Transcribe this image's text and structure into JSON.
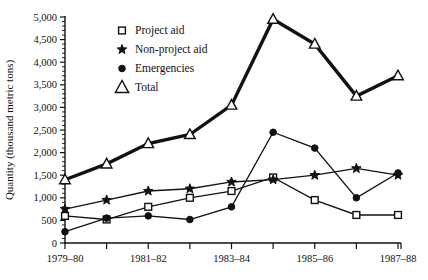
{
  "chart_data": {
    "type": "line",
    "title": "",
    "xlabel": "",
    "ylabel": "Quantity (thousand metric tons)",
    "ylim": [
      0,
      5000
    ],
    "ytick_interval": 500,
    "yminor_interval": 100,
    "grid": false,
    "legend_position": "upper-center-left",
    "categories": [
      "1979-80",
      "1980-81",
      "1981-82",
      "1982-83",
      "1983-84",
      "1984-85",
      "1985-86",
      "1986-87",
      "1987-88"
    ],
    "xtick_labels": [
      "1979–80",
      "",
      "1981–82",
      "",
      "1983–84",
      "",
      "1985–86",
      "",
      "1987–88"
    ],
    "ytick_labels": [
      "0",
      "500",
      "1,000",
      "1,500",
      "2,000",
      "2,500",
      "3,000",
      "3,500",
      "4,000",
      "4,500",
      "5,000"
    ],
    "ytick_values": [
      0,
      500,
      1000,
      1500,
      2000,
      2500,
      3000,
      3500,
      4000,
      4500,
      5000
    ],
    "series": [
      {
        "name": "Project aid",
        "marker": "square",
        "values": [
          600,
          520,
          800,
          1000,
          1150,
          1450,
          950,
          620,
          620
        ]
      },
      {
        "name": "Non-project aid",
        "marker": "star",
        "values": [
          750,
          950,
          1150,
          1200,
          1350,
          1400,
          1500,
          1650,
          1500
        ]
      },
      {
        "name": "Emergencies",
        "marker": "circle",
        "values": [
          250,
          550,
          600,
          520,
          800,
          2450,
          2100,
          1000,
          1550
        ]
      },
      {
        "name": "Total",
        "marker": "triangle",
        "values": [
          1400,
          1750,
          2200,
          2400,
          3050,
          4950,
          4400,
          3250,
          3700
        ]
      }
    ]
  },
  "legend": {
    "items": [
      {
        "label": "Project aid",
        "marker": "square"
      },
      {
        "label": "Non-project aid",
        "marker": "star"
      },
      {
        "label": "Emergencies",
        "marker": "circle"
      },
      {
        "label": "Total",
        "marker": "triangle"
      }
    ]
  },
  "axis": {
    "y_title": "Quantity (thousand metric tons)"
  }
}
